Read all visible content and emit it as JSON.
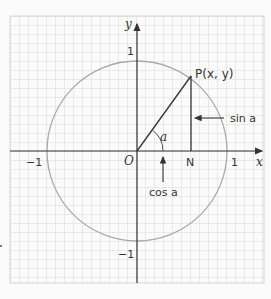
{
  "diagram": {
    "type": "unit-circle",
    "axes": {
      "x_label": "x",
      "y_label": "y",
      "origin_label": "O",
      "x_ticks": [
        {
          "value": -1,
          "label": "−1"
        },
        {
          "value": 1,
          "label": "1"
        }
      ],
      "y_ticks": [
        {
          "value": 1,
          "label": "1"
        },
        {
          "value": -1,
          "label": "−1"
        }
      ]
    },
    "point_P": {
      "label": "P(x, y)",
      "x": 0.6,
      "y": 0.83
    },
    "point_N": {
      "label": "N"
    },
    "angle_label": "a",
    "annotations": {
      "sin": "sin a",
      "cos": "cos a"
    },
    "colors": {
      "grid": "#c9c9c9",
      "axes": "#333333",
      "circle": "#a9a9a9",
      "background": "#fbfbfb"
    }
  }
}
